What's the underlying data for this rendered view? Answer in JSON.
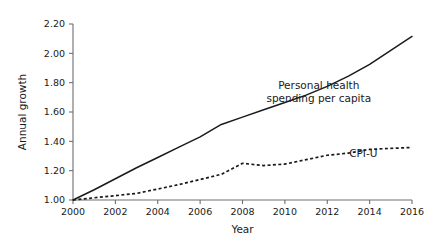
{
  "chart_data": {
    "type": "line",
    "title": "",
    "xlabel": "Year",
    "ylabel": "Annual growth",
    "xlim": [
      2000,
      2016
    ],
    "ylim": [
      1.0,
      2.2
    ],
    "grid": false,
    "legend_position": "inline-annotation",
    "x": [
      2000,
      2001,
      2002,
      2003,
      2004,
      2005,
      2006,
      2007,
      2008,
      2009,
      2010,
      2011,
      2012,
      2013,
      2014,
      2015,
      2016
    ],
    "xticks": [
      "2000",
      "2002",
      "2004",
      "2006",
      "2008",
      "2010",
      "2012",
      "2014",
      "2016"
    ],
    "xtick_values": [
      2000,
      2002,
      2004,
      2006,
      2008,
      2010,
      2012,
      2014,
      2016
    ],
    "yticks": [
      "1.00",
      "1.20",
      "1.40",
      "1.60",
      "1.80",
      "2.00",
      "2.20"
    ],
    "ytick_values": [
      1.0,
      1.2,
      1.4,
      1.6,
      1.8,
      2.0,
      2.2
    ],
    "series": [
      {
        "name": "Personal health spending per capita",
        "style": "solid",
        "label_lines": [
          "Personal health",
          "spending per capita"
        ],
        "label_x": 2011.6,
        "label_y": 1.755,
        "values": [
          1.0,
          1.07,
          1.145,
          1.22,
          1.29,
          1.36,
          1.43,
          1.515,
          1.565,
          1.615,
          1.665,
          1.715,
          1.775,
          1.845,
          1.925,
          2.02,
          2.115
        ]
      },
      {
        "name": "CPI-U",
        "style": "dashed",
        "label_lines": [
          "CPI-U"
        ],
        "label_x": 2013.7,
        "label_y": 1.295,
        "values": [
          1.0,
          1.015,
          1.03,
          1.045,
          1.075,
          1.105,
          1.14,
          1.175,
          1.25,
          1.235,
          1.245,
          1.275,
          1.305,
          1.32,
          1.345,
          1.352,
          1.358
        ]
      }
    ]
  }
}
